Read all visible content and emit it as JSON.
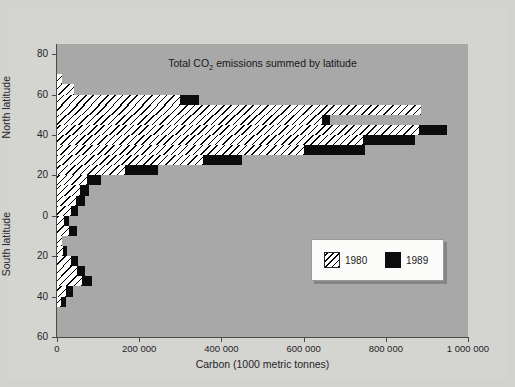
{
  "figure": {
    "background": "#d2d2ce",
    "panel_background": "#a8a8a8"
  },
  "chart_data": {
    "type": "bar",
    "orientation": "horizontal",
    "title": "Total CO",
    "title_sub": "2",
    "title_rest": " emissions summed by latitude",
    "xlabel": "Carbon (1000 metric tonnes)",
    "ylabel_north": "North latitude",
    "ylabel_south": "South latitude",
    "xlim": [
      0,
      1000000
    ],
    "ylim": [
      -60,
      85
    ],
    "xticks": [
      0,
      200000,
      400000,
      600000,
      800000,
      1000000
    ],
    "xticklabels": [
      "0",
      "200 000",
      "400 000",
      "600 000",
      "800 000",
      "1 000 000"
    ],
    "yticks": [
      80,
      60,
      40,
      20,
      0,
      -20,
      -40,
      -60
    ],
    "yticklabels": [
      "80",
      "60",
      "40",
      "20",
      "0",
      "20",
      "40",
      "60"
    ],
    "grid": false,
    "legend": {
      "position": "lower-right",
      "entries": [
        {
          "name": "1980",
          "pattern": "hatched",
          "color": "#ffffff"
        },
        {
          "name": "1989",
          "pattern": "solid",
          "color": "#0c0c0c"
        }
      ]
    },
    "series": [
      {
        "name": "1980",
        "pattern": "hatched"
      },
      {
        "name": "1989",
        "pattern": "solid"
      }
    ],
    "latitude_bands": [
      70,
      65,
      60,
      55,
      50,
      45,
      40,
      35,
      30,
      25,
      20,
      15,
      10,
      5,
      0,
      -5,
      -10,
      -15,
      -20,
      -25,
      -30,
      -35,
      -40,
      -45
    ],
    "bands": [
      {
        "lat_top": 70,
        "lat_bottom": 65,
        "v1980": 11000,
        "v1989": 11000
      },
      {
        "lat_top": 65,
        "lat_bottom": 60,
        "v1980": 42000,
        "v1989": 42000
      },
      {
        "lat_top": 60,
        "lat_bottom": 55,
        "v1980": 300000,
        "v1989": 345000
      },
      {
        "lat_top": 55,
        "lat_bottom": 50,
        "v1980": 885000,
        "v1989": 885000
      },
      {
        "lat_top": 50,
        "lat_bottom": 45,
        "v1980": 645000,
        "v1989": 665000
      },
      {
        "lat_top": 45,
        "lat_bottom": 40,
        "v1980": 880000,
        "v1989": 950000
      },
      {
        "lat_top": 40,
        "lat_bottom": 35,
        "v1980": 745000,
        "v1989": 870000
      },
      {
        "lat_top": 35,
        "lat_bottom": 30,
        "v1980": 600000,
        "v1989": 750000
      },
      {
        "lat_top": 30,
        "lat_bottom": 25,
        "v1980": 355000,
        "v1989": 450000
      },
      {
        "lat_top": 25,
        "lat_bottom": 20,
        "v1980": 165000,
        "v1989": 245000
      },
      {
        "lat_top": 20,
        "lat_bottom": 15,
        "v1980": 72000,
        "v1989": 108000
      },
      {
        "lat_top": 15,
        "lat_bottom": 10,
        "v1980": 56000,
        "v1989": 78000
      },
      {
        "lat_top": 10,
        "lat_bottom": 5,
        "v1980": 46000,
        "v1989": 68000
      },
      {
        "lat_top": 5,
        "lat_bottom": 0,
        "v1980": 33000,
        "v1989": 52000
      },
      {
        "lat_top": 0,
        "lat_bottom": -5,
        "v1980": 17000,
        "v1989": 30000
      },
      {
        "lat_top": -5,
        "lat_bottom": -10,
        "v1980": 28000,
        "v1989": 48000
      },
      {
        "lat_top": -10,
        "lat_bottom": -15,
        "v1980": 12000,
        "v1989": 12000
      },
      {
        "lat_top": -15,
        "lat_bottom": -20,
        "v1980": 14000,
        "v1989": 25000
      },
      {
        "lat_top": -20,
        "lat_bottom": -25,
        "v1980": 33000,
        "v1989": 50000
      },
      {
        "lat_top": -25,
        "lat_bottom": -30,
        "v1980": 48000,
        "v1989": 68000
      },
      {
        "lat_top": -30,
        "lat_bottom": -35,
        "v1980": 62000,
        "v1989": 85000
      },
      {
        "lat_top": -35,
        "lat_bottom": -40,
        "v1980": 22000,
        "v1989": 38000
      },
      {
        "lat_top": -40,
        "lat_bottom": -45,
        "v1980": 10000,
        "v1989": 22000
      }
    ]
  }
}
